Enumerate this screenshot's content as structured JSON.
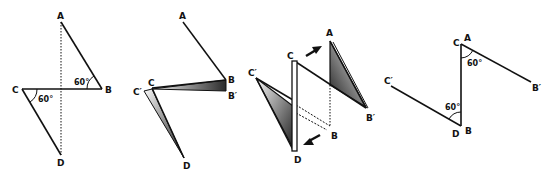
{
  "figure": {
    "panels": [
      {
        "id": "panel-1",
        "labels": {
          "A": "A",
          "B": "B",
          "C": "C",
          "D": "D"
        },
        "angles": [
          "60°",
          "60°"
        ]
      },
      {
        "id": "panel-2",
        "labels": {
          "A": "A",
          "B": "B",
          "B_prime": "B′",
          "C": "C",
          "C_prime": "C′",
          "D": "D"
        }
      },
      {
        "id": "panel-3",
        "labels": {
          "A": "A",
          "B": "B",
          "B_prime": "B′",
          "C": "C",
          "C_prime": "C′",
          "D": "D"
        }
      },
      {
        "id": "panel-4",
        "labels": {
          "A": "A",
          "B": "B",
          "B_prime": "B′",
          "C": "C",
          "C_prime": "C′",
          "D": "D"
        },
        "angles": [
          "60°",
          "60°"
        ]
      }
    ],
    "colors": {
      "line": "#111111",
      "shade_dark": "#333333",
      "shade_light": "#f2f2f2"
    }
  }
}
